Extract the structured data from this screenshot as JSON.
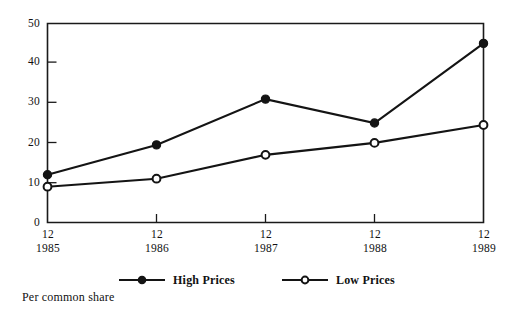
{
  "chart_data": {
    "type": "line",
    "title": "",
    "subtitle": "",
    "xlabel": "",
    "ylabel": "",
    "caption": "Per common share",
    "categories": [
      "12\n1985",
      "12\n1986",
      "12\n1987",
      "12\n1988",
      "12\n1989"
    ],
    "x_tick_months": [
      "12",
      "12",
      "12",
      "12",
      "12"
    ],
    "x_tick_years": [
      "1985",
      "1986",
      "1987",
      "1988",
      "1989"
    ],
    "y_ticks": [
      "0",
      "10",
      "20",
      "30",
      "40",
      "50"
    ],
    "y_tick_values": [
      0,
      10,
      20,
      30,
      40,
      50
    ],
    "ylim": [
      0,
      50
    ],
    "grid": false,
    "legend_position": "below",
    "series": [
      {
        "name": "High Prices",
        "marker": "filled-circle",
        "color": "#141414",
        "values": [
          12,
          19.5,
          31,
          25,
          45
        ]
      },
      {
        "name": "Low Prices",
        "marker": "open-circle",
        "color": "#141414",
        "values": [
          9,
          11,
          17,
          20,
          24.5
        ]
      }
    ]
  },
  "legend": {
    "items": [
      {
        "label": "High Prices",
        "marker": "filled-circle"
      },
      {
        "label": "Low Prices",
        "marker": "open-circle"
      }
    ]
  },
  "caption": {
    "text": "Per common share"
  },
  "colors": {
    "ink": "#141414",
    "paper": "#ffffff"
  }
}
